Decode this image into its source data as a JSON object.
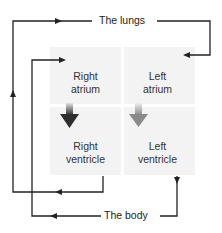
{
  "diagram": {
    "title": "",
    "nodes": {
      "lungs": "The lungs",
      "body": "The body",
      "right_atrium": [
        "Right",
        "atrium"
      ],
      "left_atrium": [
        "Left",
        "atrium"
      ],
      "right_ventricle": [
        "Right",
        "ventricle"
      ],
      "left_ventricle": [
        "Left",
        "ventricle"
      ]
    },
    "edges": [
      {
        "from": "right_ventricle",
        "to": "lungs"
      },
      {
        "from": "lungs",
        "to": "left_atrium"
      },
      {
        "from": "left_ventricle",
        "to": "body"
      },
      {
        "from": "body",
        "to": "right_atrium"
      },
      {
        "from": "right_atrium",
        "to": "right_ventricle"
      },
      {
        "from": "left_atrium",
        "to": "left_ventricle"
      }
    ],
    "colors": {
      "line": "#222222",
      "panel": "#f3f3f3",
      "arrow_dark": "#3a3a3a",
      "arrow_light": "#9a9a9a"
    }
  }
}
